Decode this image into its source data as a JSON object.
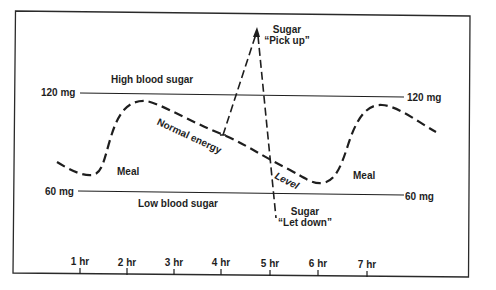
{
  "diagram": {
    "title": "",
    "thresholds": {
      "high": {
        "value_label": "120 mg",
        "zone_label": "High blood sugar"
      },
      "low": {
        "value_label": "60 mg",
        "zone_label": "Low blood sugar"
      }
    },
    "curve_labels": {
      "normal_energy": "Normal energy",
      "level": "Level",
      "meal_1": "Meal",
      "meal_2": "Meal"
    },
    "annotations": {
      "pick_up": {
        "line1": "Sugar",
        "line2": "“Pick up”"
      },
      "let_down": {
        "line1": "Sugar",
        "line2": "“Let down”"
      }
    },
    "x_axis": {
      "ticks": [
        {
          "label": "1 hr",
          "x": 80
        },
        {
          "label": "2 hr",
          "x": 127
        },
        {
          "label": "3 hr",
          "x": 174
        },
        {
          "label": "4 hr",
          "x": 221
        },
        {
          "label": "5 hr",
          "x": 270
        },
        {
          "label": "6 hr",
          "x": 318
        },
        {
          "label": "7 hr",
          "x": 367
        }
      ]
    },
    "colors": {
      "ink": "#1e1e1e",
      "background": "#ffffff"
    }
  }
}
